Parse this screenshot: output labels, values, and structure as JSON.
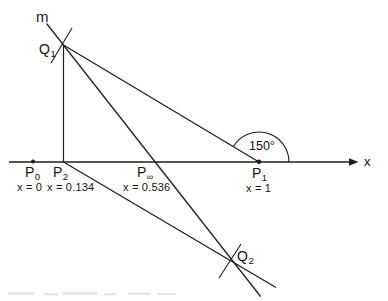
{
  "figure": {
    "line_m_label": "m",
    "axis_label": "x",
    "angle_label": "150°",
    "points": {
      "q1": {
        "base": "Q",
        "sub": "1"
      },
      "q2": {
        "base": "Q",
        "sub": "2"
      },
      "p0": {
        "base": "P",
        "sub": "0",
        "value": "x = 0"
      },
      "p2": {
        "base": "P",
        "sub": "2",
        "value": "x = 0.134"
      },
      "pinf": {
        "base": "P",
        "sub": "∞",
        "value": "x = 0.536"
      },
      "p1": {
        "base": "P",
        "sub": "1",
        "value": "x = 1"
      }
    },
    "colors": {
      "line": "#1d1d1b",
      "background": "#ffffff",
      "text": "#141414",
      "caption_remnant": "#c9c9c5"
    }
  }
}
